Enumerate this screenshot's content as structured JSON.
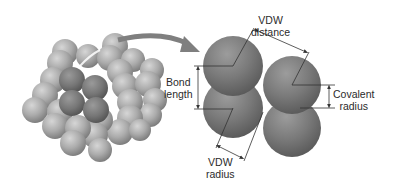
{
  "diagram": {
    "type": "molecular-model",
    "labels": {
      "vdw_distance": {
        "line1": "VDW",
        "line2": "distance"
      },
      "bond_length": {
        "line1": "Bond",
        "line2": "length"
      },
      "covalent_radius": {
        "line1": "Covalent",
        "line2": "radius"
      },
      "vdw_radius": {
        "line1": "VDW",
        "line2": "radius"
      }
    },
    "colors": {
      "background": "#ffffff",
      "lattice_atom": "#a8a8a8",
      "highlight_atom": "#7a7a7a",
      "detail_atom": "#7d7d7d",
      "arrow": "#7f7f7f",
      "line": "#333333",
      "text": "#2b2b2b"
    },
    "left_panel": "Molecular crystal lattice of diatomic molecules (space-filling model) with one highlighted molecule pair",
    "right_panel": "Two diatomic molecules in contact showing bond length, covalent radius, VDW radius and VDW distance"
  }
}
